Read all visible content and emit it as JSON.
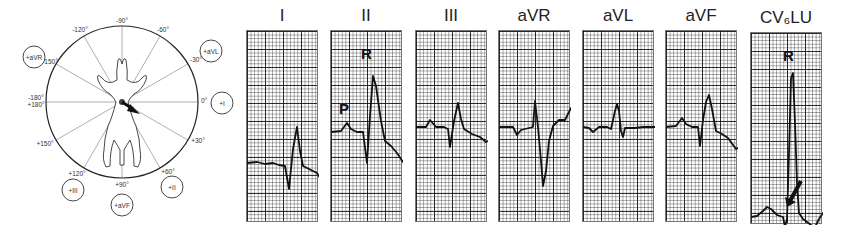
{
  "axis_diagram": {
    "angle_labels": [
      {
        "text": "-90°",
        "x": 122,
        "y": 23
      },
      {
        "text": "-120°",
        "x": 80,
        "y": 32
      },
      {
        "text": "-60°",
        "x": 163,
        "y": 32
      },
      {
        "text": "-150°",
        "x": 50,
        "y": 64
      },
      {
        "text": "-30°",
        "x": 196,
        "y": 62
      },
      {
        "text": "-180°",
        "x": 36,
        "y": 100
      },
      {
        "text": "+180°",
        "x": 36,
        "y": 107
      },
      {
        "text": "0°",
        "x": 204,
        "y": 103
      },
      {
        "text": "+150°",
        "x": 45,
        "y": 146
      },
      {
        "text": "+30°",
        "x": 198,
        "y": 143
      },
      {
        "text": "+120°",
        "x": 77,
        "y": 176
      },
      {
        "text": "+60°",
        "x": 168,
        "y": 174
      },
      {
        "text": "+90°",
        "x": 122,
        "y": 187
      }
    ],
    "lead_circles": [
      {
        "text": "+aVR",
        "x": 34,
        "y": 57
      },
      {
        "text": "+aVL",
        "x": 211,
        "y": 51
      },
      {
        "text": "+I",
        "x": 222,
        "y": 103
      },
      {
        "text": "+III",
        "x": 73,
        "y": 190
      },
      {
        "text": "+II",
        "x": 172,
        "y": 187
      },
      {
        "text": "+aVF",
        "x": 122,
        "y": 205
      }
    ],
    "mean_axis_arrow_deg": 30
  },
  "leads": [
    {
      "name": "I",
      "x": 246,
      "w": 72,
      "y": 30,
      "h": 192,
      "annotations": []
    },
    {
      "name": "II",
      "x": 330,
      "w": 72,
      "y": 30,
      "h": 192,
      "annotations": [
        {
          "text": "P",
          "x": 8,
          "y": 69
        },
        {
          "text": "R",
          "x": 30,
          "y": 14
        }
      ]
    },
    {
      "name": "III",
      "x": 415,
      "w": 72,
      "y": 30,
      "h": 192,
      "annotations": []
    },
    {
      "name": "aVR",
      "x": 498,
      "w": 72,
      "y": 30,
      "h": 192,
      "annotations": []
    },
    {
      "name": "aVL",
      "x": 582,
      "w": 72,
      "y": 30,
      "h": 192,
      "annotations": []
    },
    {
      "name": "aVF",
      "x": 665,
      "w": 72,
      "y": 30,
      "h": 192,
      "annotations": []
    },
    {
      "name": "CV6LU",
      "x": 750,
      "w": 72,
      "y": 32,
      "h": 192,
      "annotations": [
        {
          "text": "R",
          "x": 32,
          "y": 14
        }
      ]
    }
  ],
  "title_display": [
    "I",
    "II",
    "III",
    "aVR",
    "aVL",
    "aVF",
    "CV₆LU"
  ],
  "traces": {
    "I": "0,132 10,131 18,133 26,132 32,134 38,135 42,158 46,118 50,96 53,120 56,135 62,138 70,142 76,152 80,155 86,152 90,144 96,141 72,141",
    "II": "0,101 10,100 16,92 20,98 26,101 32,101 36,132 39,85 42,45 45,55 50,90 54,110 60,115 66,122 74,134 80,130 86,117 92,115",
    "III": "0,96 10,96 14,89 20,96 28,96 32,98 34,116 38,90 42,72 45,88 48,98 56,103 64,106 70,111 76,108 80,105",
    "aVR": "0,96 14,96 18,104 22,99 30,97 34,96 36,70 39,96 42,130 44,155 47,140 50,110 54,95 60,89 66,89 72,77 76,80 82,96",
    "aVL": "0,96 6,97 10,101 16,96 24,96 28,98 32,80 34,73 36,80 38,100 40,106 42,97 52,97 60,96 68,96 72,96",
    "aVF": "0,96 10,95 16,87 20,93 26,96 32,96 34,115 37,89 40,71 43,64 46,78 50,100 56,103 62,107 70,118 74,116 80,103",
    "CV6LU": "0,184 6,183 12,178 16,174 20,176 26,182 32,184 34,194 36,186 38,120 40,45 42,40 44,90 46,150 48,180 52,186 60,192 64,194 68,186 72,180 76,178 72,178"
  },
  "cv6lu_arrow": {
    "x1": 50,
    "y1": 148,
    "x2": 36,
    "y2": 174
  }
}
